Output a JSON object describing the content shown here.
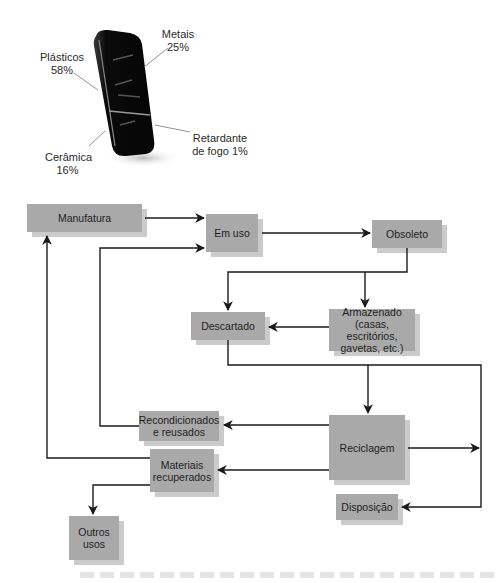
{
  "phone_composition": {
    "title": "",
    "components": [
      {
        "name": "Plásticos",
        "percent": "58%"
      },
      {
        "name": "Metais",
        "percent": "25%"
      },
      {
        "name": "Cerâmica",
        "percent": "16%"
      },
      {
        "name": "Retardante de fogo",
        "percent": "1%"
      }
    ],
    "labels": {
      "plasticos": "Plásticos\n58%",
      "metais": "Metais\n25%",
      "ceramica": "Cerâmica\n16%",
      "retardante": "Retardante\nde fogo 1%"
    }
  },
  "flow": {
    "nodes": {
      "manufatura": "Manufatura",
      "em_uso": "Em uso",
      "obsoleto": "Obsoleto",
      "descartado": "Descartado",
      "armazenado": "Armazenado\n(casas, escritórios,\ngavetas, etc.)",
      "recondicionados": "Recondicionados\ne reusados",
      "reciclagem": "Reciclagem",
      "materiais": "Materiais\nrecuperados",
      "disposicao": "Disposição",
      "outros_usos": "Outros\nusos"
    },
    "edges": [
      [
        "Manufatura",
        "Em uso"
      ],
      [
        "Em uso",
        "Obsoleto"
      ],
      [
        "Obsoleto",
        "Descartado"
      ],
      [
        "Obsoleto",
        "Armazenado"
      ],
      [
        "Armazenado",
        "Descartado"
      ],
      [
        "Descartado",
        "Reciclagem"
      ],
      [
        "Descartado",
        "Disposição"
      ],
      [
        "Reciclagem",
        "Recondicionados e reusados"
      ],
      [
        "Reciclagem",
        "Materiais recuperados"
      ],
      [
        "Reciclagem",
        "Disposição"
      ],
      [
        "Recondicionados e reusados",
        "Em uso"
      ],
      [
        "Materiais recuperados",
        "Manufatura"
      ],
      [
        "Materiais recuperados",
        "Outros usos"
      ]
    ]
  },
  "colors": {
    "box_fill": "#a9a9a9",
    "box_shadow": "#cbcbcb",
    "line": "#1a1a1a"
  }
}
